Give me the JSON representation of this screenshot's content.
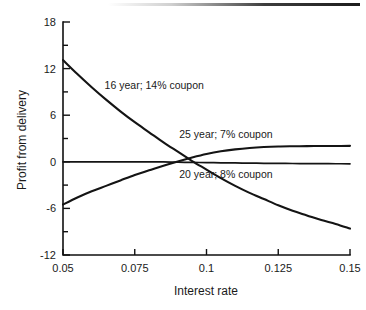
{
  "chart_data": {
    "type": "line",
    "title": "",
    "xlabel": "Interest rate",
    "ylabel": "Profit from delivery",
    "xlim": [
      0.05,
      0.15
    ],
    "ylim": [
      -12,
      18
    ],
    "grid": false,
    "legend_position": "inline-annotations",
    "x_ticks": [
      "0.05",
      "0.075",
      "0.1",
      "0.125",
      "0.15"
    ],
    "x_tick_values": [
      0.05,
      0.075,
      0.1,
      0.125,
      0.15
    ],
    "y_ticks": [
      "18",
      "12",
      "6",
      "0",
      "-6",
      "-12"
    ],
    "y_tick_values": [
      18,
      12,
      6,
      0,
      -6,
      -12
    ],
    "y_minor_tick_values": [
      15,
      9,
      3,
      -3,
      -9
    ],
    "x": [
      0.05,
      0.055,
      0.06,
      0.065,
      0.07,
      0.075,
      0.08,
      0.085,
      0.09,
      0.095,
      0.1,
      0.105,
      0.11,
      0.115,
      0.12,
      0.125,
      0.13,
      0.135,
      0.14,
      0.145,
      0.15
    ],
    "series": [
      {
        "name": "16 year; 14% coupon",
        "label": "16 year; 14% coupon",
        "label_x": 0.0645,
        "label_y": 9.9,
        "values": [
          13.1,
          11.3,
          9.6,
          8.0,
          6.5,
          5.1,
          3.8,
          2.5,
          1.3,
          0.1,
          -1.0,
          -2.1,
          -3.1,
          -4.0,
          -4.8,
          -5.6,
          -6.3,
          -6.9,
          -7.5,
          -8.0,
          -8.6
        ]
      },
      {
        "name": "25 year; 7% coupon",
        "label": "25 year; 7% coupon",
        "label_x": 0.0905,
        "label_y": 3.6,
        "values": [
          -5.5,
          -4.6,
          -3.8,
          -3.1,
          -2.4,
          -1.7,
          -1.1,
          -0.5,
          0.05,
          0.55,
          1.0,
          1.35,
          1.6,
          1.78,
          1.9,
          1.97,
          2.0,
          2.02,
          2.03,
          2.04,
          2.05
        ]
      },
      {
        "name": "20 year; 8% coupon",
        "label": "20 year; 8% coupon",
        "label_x": 0.0905,
        "label_y": -1.6,
        "values": [
          0.0,
          0.0,
          0.0,
          0.0,
          0.0,
          0.0,
          0.0,
          -0.02,
          -0.05,
          -0.08,
          -0.1,
          -0.13,
          -0.15,
          -0.17,
          -0.19,
          -0.2,
          -0.22,
          -0.23,
          -0.24,
          -0.25,
          -0.26
        ]
      }
    ],
    "colors": {
      "curve": "#141414",
      "axis": "#111111",
      "background": "#ffffff"
    }
  }
}
